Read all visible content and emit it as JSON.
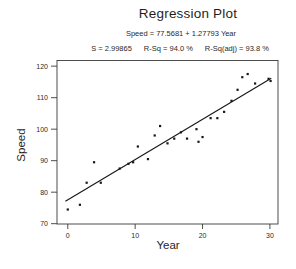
{
  "figure": {
    "title": "Regression Plot",
    "equation": "Speed = 77.5681 + 1.27793 Year",
    "stats": {
      "s": "S = 2.99865",
      "r_sq": "R-Sq = 94.0 %",
      "r_sq_adj": "R-Sq(adj) = 93.8 %"
    },
    "x_axis_label": "Year",
    "y_axis_label": "Speed",
    "colors": {
      "text": "#222222",
      "axis": "#3a3a3a",
      "point": "#161616",
      "fit_line": "#161616",
      "background": "#ffffff"
    }
  },
  "chart_data": {
    "type": "scatter",
    "title": "Regression Plot",
    "subtitle": "Speed = 77.5681 + 1.27793 Year",
    "annotations": [
      "S = 2.99865",
      "R-Sq = 94.0 %",
      "R-Sq(adj) = 93.8 %"
    ],
    "xlabel": "Year",
    "ylabel": "Speed",
    "xlim": [
      -1.6,
      31.2
    ],
    "ylim": [
      69.9,
      121.8
    ],
    "x_ticks": [
      0,
      10,
      20,
      30
    ],
    "y_ticks": [
      70,
      80,
      90,
      100,
      110,
      120
    ],
    "grid": false,
    "legend": false,
    "points": [
      [
        0,
        74.5
      ],
      [
        1.8,
        76
      ],
      [
        2.8,
        83
      ],
      [
        3.9,
        89.5
      ],
      [
        4.9,
        83
      ],
      [
        7.7,
        87.5
      ],
      [
        9.0,
        89
      ],
      [
        9.7,
        89.5
      ],
      [
        10.4,
        94.5
      ],
      [
        11.9,
        90.5
      ],
      [
        12.9,
        98
      ],
      [
        13.7,
        101
      ],
      [
        14.8,
        95.5
      ],
      [
        15.8,
        97
      ],
      [
        16.8,
        99
      ],
      [
        17.7,
        97
      ],
      [
        19.1,
        100
      ],
      [
        19.4,
        96
      ],
      [
        20.0,
        97.5
      ],
      [
        21.2,
        103.5
      ],
      [
        22.2,
        103.5
      ],
      [
        23.2,
        105.5
      ],
      [
        24.3,
        109
      ],
      [
        25.2,
        112.5
      ],
      [
        25.9,
        116.5
      ],
      [
        26.7,
        117.5
      ],
      [
        27.8,
        114.5
      ],
      [
        29.8,
        116
      ],
      [
        30.1,
        115.3
      ]
    ],
    "fit_line": {
      "equation": "Speed = 77.5681 + 1.27793 Year",
      "intercept": 77.5681,
      "slope": 1.27793,
      "x_start": -0.35,
      "x_end": 30.2
    }
  }
}
